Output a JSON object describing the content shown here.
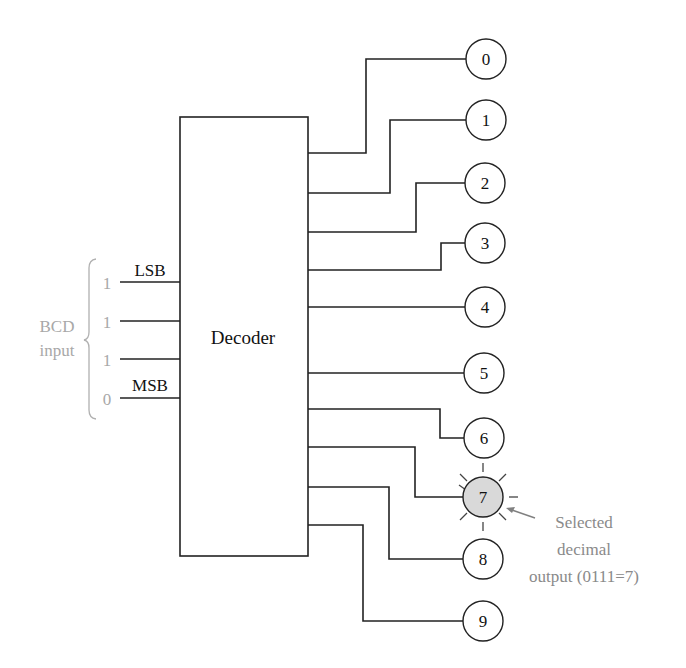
{
  "decoder": {
    "label": "Decoder"
  },
  "inputs": {
    "group_label_line1": "BCD",
    "group_label_line2": "input",
    "lsb_label": "LSB",
    "msb_label": "MSB",
    "bits": [
      "1",
      "1",
      "1",
      "0"
    ]
  },
  "outputs": {
    "labels": [
      "0",
      "1",
      "2",
      "3",
      "4",
      "5",
      "6",
      "7",
      "8",
      "9"
    ],
    "selected_index": 7
  },
  "annotation": {
    "line1": "Selected",
    "line2": "decimal",
    "line3": "output (0111=7)"
  },
  "colors": {
    "line": "#222222",
    "selected_fill": "#d9d9d9",
    "input_gray": "#a8a8a8",
    "annotation_gray": "#8a8a8a"
  }
}
